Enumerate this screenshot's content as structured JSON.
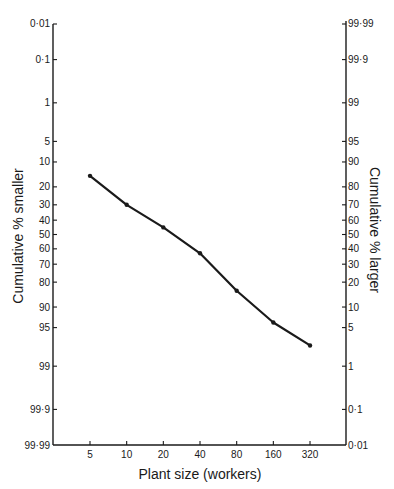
{
  "chart_data": {
    "type": "line",
    "title": "",
    "xlabel": "Plant size (workers)",
    "ylabel": "Cumulative % smaller",
    "ylabel_right": "Cumulative % larger",
    "x_scale": "log2",
    "y_scale": "normal-probability",
    "x_ticks": [
      5,
      10,
      20,
      40,
      80,
      160,
      320
    ],
    "x_tick_labels": [
      "5",
      "10",
      "20",
      "40",
      "80",
      "160",
      "320"
    ],
    "y_left_ticks": [
      0.01,
      0.1,
      1,
      5,
      10,
      20,
      30,
      40,
      50,
      60,
      70,
      80,
      90,
      95,
      99,
      99.9,
      99.99
    ],
    "y_left_tick_labels": [
      "0·01",
      "0·1",
      "1",
      "5",
      "10",
      "20",
      "30",
      "40",
      "50",
      "60",
      "70",
      "80",
      "90",
      "95",
      "99",
      "99·9",
      "99·99"
    ],
    "y_right_ticks": [
      99.99,
      99.9,
      99,
      95,
      90,
      80,
      70,
      60,
      50,
      40,
      30,
      20,
      10,
      5,
      1,
      0.1,
      0.01
    ],
    "y_right_tick_labels": [
      "99·99",
      "99·9",
      "99",
      "95",
      "90",
      "80",
      "70",
      "60",
      "50",
      "40",
      "30",
      "20",
      "10",
      "5",
      "1",
      "0·1",
      "0·01"
    ],
    "ylim": [
      0.01,
      99.99
    ],
    "xlim": [
      2.5,
      640
    ],
    "grid": false,
    "legend": "none",
    "series": [
      {
        "name": "Cumulative % smaller",
        "x": [
          5,
          10,
          20,
          40,
          80,
          160,
          320
        ],
        "values": [
          15,
          30,
          45,
          63,
          84,
          94,
          97.5
        ]
      }
    ]
  },
  "colors": {
    "ink": "#1a1a1a",
    "background": "#ffffff"
  }
}
